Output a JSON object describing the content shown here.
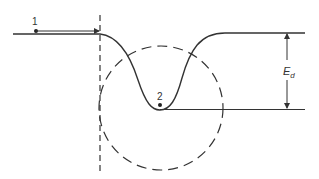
{
  "diagram": {
    "labels": {
      "point1": "1",
      "point2": "2",
      "energy_main": "E",
      "energy_sub": "d"
    },
    "colors": {
      "stroke": "#333333",
      "background": "#ffffff"
    }
  }
}
